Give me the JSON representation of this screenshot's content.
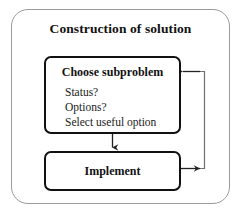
{
  "diagram": {
    "title": "Construction of solution",
    "type": "flowchart",
    "nodes": [
      {
        "id": "choose-subproblem",
        "heading": "Choose subproblem",
        "lines": [
          "Status?",
          "Options?",
          "Select useful option"
        ]
      },
      {
        "id": "implement",
        "heading": "Implement",
        "lines": []
      }
    ],
    "edges": [
      {
        "id": "choose-to-implement",
        "from": "choose-subproblem",
        "to": "implement",
        "label": "",
        "direction": "down"
      },
      {
        "id": "implement-to-choose",
        "from": "implement",
        "to": "choose-subproblem",
        "label": "",
        "direction": "feedback-loop-right"
      }
    ],
    "colors": {
      "outer_border": "#9a9a9a",
      "box_border": "#111111",
      "connector": "#333333",
      "text": "#1a1a1a",
      "background": "#ffffff"
    }
  }
}
